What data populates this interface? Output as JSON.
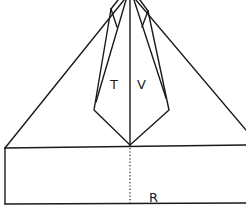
{
  "diagram": {
    "type": "origami-fold-diagram",
    "labels": {
      "left_flap": "T",
      "right_flap": "V",
      "base": "R"
    },
    "colors": {
      "line": "#1a1a1a",
      "background": "#ffffff"
    }
  }
}
